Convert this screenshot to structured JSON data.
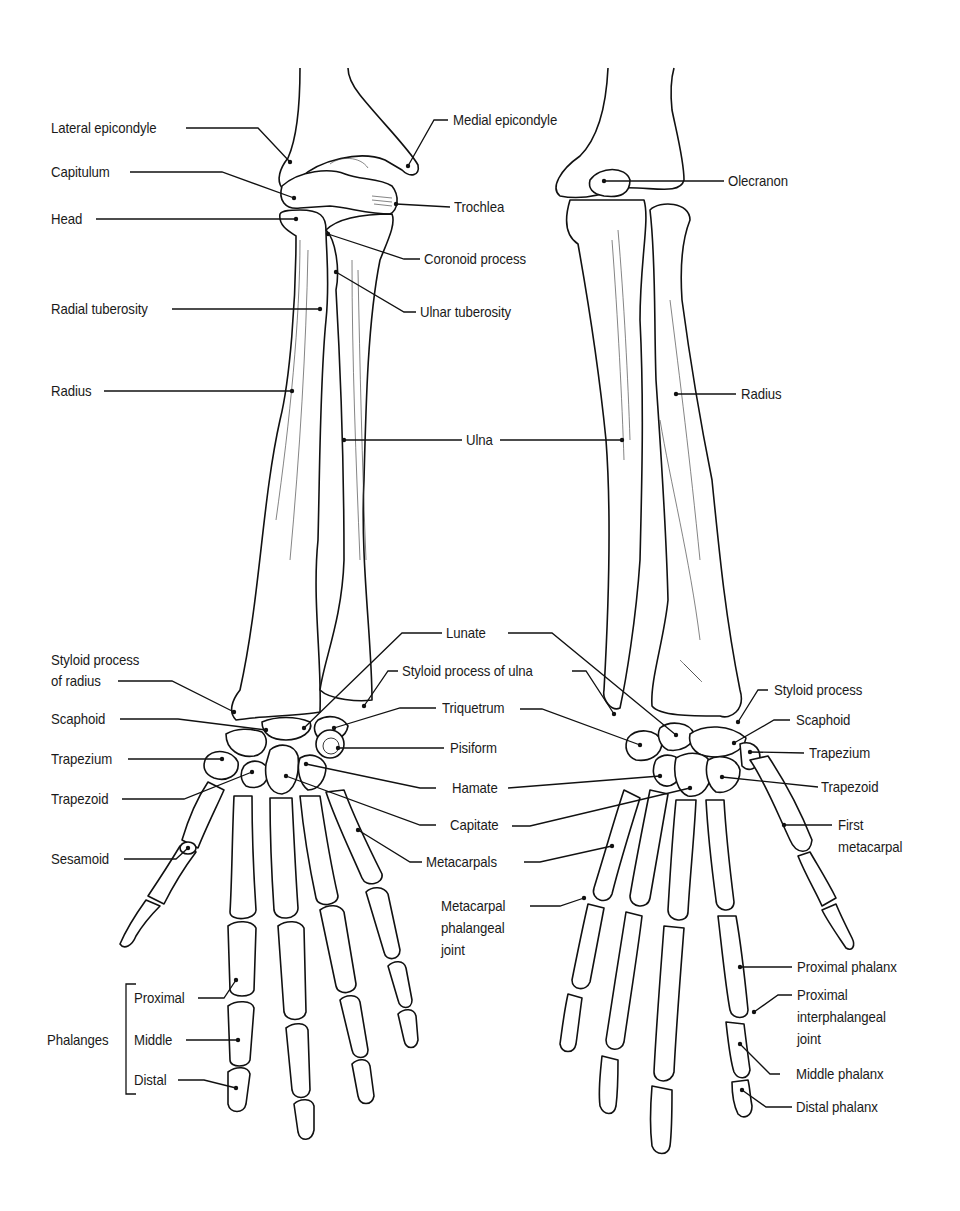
{
  "figure": {
    "views": [
      "anterior",
      "posterior"
    ]
  },
  "left_view": {
    "labels": {
      "lateral_epicondyle": "Lateral epicondyle",
      "medial_epicondyle": "Medial epicondyle",
      "capitulum": "Capitulum",
      "trochlea": "Trochlea",
      "head": "Head",
      "coronoid_process": "Coronoid process",
      "radial_tuberosity": "Radial tuberosity",
      "ulnar_tuberosity": "Ulnar tuberosity",
      "radius": "Radius",
      "ulna": "Ulna",
      "lunate": "Lunate",
      "styloid_process_of_radius_1": "Styloid process",
      "styloid_process_of_radius_2": "of radius",
      "styloid_process_of_ulna": "Styloid process of ulna",
      "scaphoid": "Scaphoid",
      "triquetrum": "Triquetrum",
      "trapezium": "Trapezium",
      "pisiform": "Pisiform",
      "hamate": "Hamate",
      "trapezoid": "Trapezoid",
      "capitate": "Capitate",
      "sesamoid": "Sesamoid",
      "metacarpals": "Metacarpals",
      "phalanges": "Phalanges",
      "proximal": "Proximal",
      "middle": "Middle",
      "distal": "Distal"
    }
  },
  "right_view": {
    "labels": {
      "olecranon": "Olecranon",
      "radius": "Radius",
      "styloid_process": "Styloid process",
      "scaphoid": "Scaphoid",
      "trapezium": "Trapezium",
      "trapezoid": "Trapezoid",
      "first_metacarpal_1": "First",
      "first_metacarpal_2": "metacarpal",
      "mcp_joint_1": "Metacarpal",
      "mcp_joint_2": "phalangeal",
      "mcp_joint_3": "joint",
      "proximal_phalanx": "Proximal phalanx",
      "pip_joint_1": "Proximal",
      "pip_joint_2": "interphalangeal",
      "pip_joint_3": "joint",
      "middle_phalanx": "Middle phalanx",
      "distal_phalanx": "Distal phalanx"
    }
  },
  "colors": {
    "ink": "#111111",
    "background": "#ffffff"
  }
}
